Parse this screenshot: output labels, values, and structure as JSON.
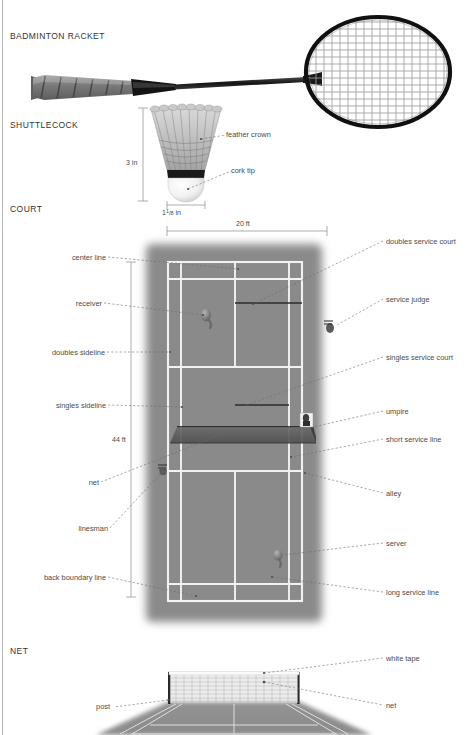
{
  "document": {
    "subject": "badminton",
    "sections": [
      {
        "id": "racket",
        "title": "BADMINTON RACKET"
      },
      {
        "id": "shuttlecock",
        "title": "SHUTTLECOCK"
      },
      {
        "id": "court",
        "title": "COURT"
      },
      {
        "id": "net",
        "title": "NET"
      }
    ]
  },
  "shuttlecock": {
    "labels": [
      {
        "name": "feather-crown",
        "text": "feather crown"
      },
      {
        "name": "cork-tip",
        "text": "cork tip"
      }
    ],
    "dimensions": {
      "height": "3 in",
      "width_whole": "1",
      "width_num": "1",
      "width_den": "8",
      "width_unit": "in"
    }
  },
  "court": {
    "dimensions": {
      "width": "20 ft",
      "length": "44 ft"
    },
    "labels_left": [
      {
        "name": "center-line",
        "text": "center line"
      },
      {
        "name": "receiver",
        "text": "receiver"
      },
      {
        "name": "doubles-sideline",
        "text": "doubles sideline"
      },
      {
        "name": "singles-sideline",
        "text": "singles sideline"
      },
      {
        "name": "net",
        "text": "net"
      },
      {
        "name": "linesman",
        "text": "linesman"
      },
      {
        "name": "back-boundary-line",
        "text": "back boundary line"
      }
    ],
    "labels_right": [
      {
        "name": "doubles-service-court",
        "text": "doubles service court"
      },
      {
        "name": "service-judge",
        "text": "service judge"
      },
      {
        "name": "singles-service-court",
        "text": "singles service court"
      },
      {
        "name": "umpire",
        "text": "umpire"
      },
      {
        "name": "short-service-line",
        "text": "short service line"
      },
      {
        "name": "alley",
        "text": "alley"
      },
      {
        "name": "server",
        "text": "server"
      },
      {
        "name": "long-service-line",
        "text": "long service line"
      }
    ],
    "colors": {
      "surface": "#8a8a8a",
      "line": "#f2f2f2",
      "net": "#5a5a5a"
    }
  },
  "net_view": {
    "labels": [
      {
        "name": "white-tape",
        "text": "white tape"
      },
      {
        "name": "post",
        "text": "post"
      },
      {
        "name": "net",
        "text": "net"
      }
    ]
  }
}
